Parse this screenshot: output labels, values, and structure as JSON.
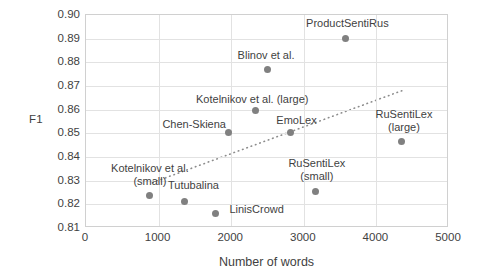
{
  "chart_data": {
    "type": "scatter",
    "title": "",
    "xlabel": "Number of words",
    "ylabel": "F1",
    "xlim": [
      0,
      5000
    ],
    "ylim": [
      0.81,
      0.9
    ],
    "xticks": [
      "0",
      "1000",
      "2000",
      "3000",
      "4000",
      "5000"
    ],
    "yticks": [
      "0.81",
      "0.82",
      "0.83",
      "0.84",
      "0.85",
      "0.86",
      "0.87",
      "0.88",
      "0.89",
      "0.90"
    ],
    "grid": true,
    "legend": "none",
    "marker_color": "#808080",
    "trendline": {
      "present": true,
      "style": "dotted",
      "color": "#8c8c8c",
      "x_start": 920,
      "y_start": 0.8285,
      "x_end": 4400,
      "y_end": 0.868
    },
    "points": [
      {
        "label": "Kotelnikov et al.\n(small)",
        "x": 880,
        "y": 0.8237,
        "label_x": 880,
        "label_y": 0.8355,
        "label_align": "center"
      },
      {
        "label": "Tutubalina",
        "x": 1350,
        "y": 0.8212,
        "label_x": 1480,
        "label_y": 0.828,
        "label_align": "center"
      },
      {
        "label": "LinisCrowd",
        "x": 1780,
        "y": 0.8162,
        "label_x": 2350,
        "label_y": 0.818,
        "label_align": "center"
      },
      {
        "label": "Chen-Skiena",
        "x": 1960,
        "y": 0.8502,
        "label_x": 1490,
        "label_y": 0.854,
        "label_align": "center"
      },
      {
        "label": "Kotelnikov et al. (large)",
        "x": 2330,
        "y": 0.8598,
        "label_x": 2290,
        "label_y": 0.8645,
        "label_align": "center"
      },
      {
        "label": "Blinov et al.",
        "x": 2500,
        "y": 0.877,
        "label_x": 2480,
        "label_y": 0.883,
        "label_align": "center"
      },
      {
        "label": "EmoLex",
        "x": 2820,
        "y": 0.8502,
        "label_x": 2900,
        "label_y": 0.8555,
        "label_align": "center"
      },
      {
        "label": "RuSentiLex\n(small)",
        "x": 3160,
        "y": 0.8255,
        "label_x": 3180,
        "label_y": 0.8375,
        "label_align": "center"
      },
      {
        "label": "ProductSentiRus",
        "x": 3580,
        "y": 0.89,
        "label_x": 3600,
        "label_y": 0.8965,
        "label_align": "center"
      },
      {
        "label": "RuSentiLex\n(large)",
        "x": 4340,
        "y": 0.8465,
        "label_x": 4380,
        "label_y": 0.858,
        "label_align": "center"
      }
    ]
  }
}
